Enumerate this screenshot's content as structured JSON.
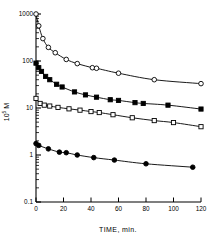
{
  "chart_data": {
    "type": "line",
    "title": "",
    "xlabel": "TIME, min.",
    "ylabel": "10^5 M",
    "ylabel_mantissa": "10",
    "ylabel_exponent": "5",
    "ylabel_unit": "M",
    "xlim": [
      0,
      120
    ],
    "ylim": [
      0.1,
      1000
    ],
    "yscale": "log",
    "xscale": "linear",
    "grid": false,
    "legend": "none",
    "xticks": [
      0,
      20,
      40,
      60,
      80,
      100,
      120
    ],
    "xticklabels": [
      "0",
      "20",
      "40",
      "60",
      "80",
      "100",
      "120"
    ],
    "yticks": [
      0.1,
      1,
      10,
      100,
      1000
    ],
    "yticklabels": [
      "0.1",
      "1",
      "10",
      "100",
      "1000"
    ],
    "minor_ticks": true,
    "series": [
      {
        "name": "open-circles",
        "marker": "open-circle",
        "color": "#000000",
        "x": [
          0,
          2,
          5,
          9,
          14,
          22,
          30,
          41,
          44,
          60,
          86,
          120
        ],
        "y": [
          1000,
          560,
          300,
          195,
          150,
          108,
          88,
          72,
          70,
          55,
          40,
          33
        ]
      },
      {
        "name": "filled-squares",
        "marker": "filled-square",
        "color": "#000000",
        "x": [
          0,
          2,
          4,
          7,
          10,
          15,
          19,
          28,
          36,
          44,
          54,
          60,
          72,
          78,
          96,
          120
        ],
        "y": [
          90,
          72,
          60,
          47,
          40,
          32,
          28,
          22,
          19,
          17,
          15,
          14.5,
          13,
          12.5,
          11.5,
          9.5
        ]
      },
      {
        "name": "open-squares",
        "marker": "open-square",
        "color": "#000000",
        "x": [
          0,
          3,
          6,
          10,
          16,
          24,
          32,
          40,
          46,
          56,
          70,
          86,
          100,
          120
        ],
        "y": [
          16,
          12.5,
          11.5,
          11,
          10.3,
          9.6,
          9.0,
          8.4,
          8.0,
          7.2,
          6.2,
          5.4,
          4.9,
          4.0
        ]
      },
      {
        "name": "filled-circles",
        "marker": "filled-circle",
        "color": "#000000",
        "x": [
          0,
          2,
          9,
          17,
          22,
          30,
          42,
          57,
          80,
          114
        ],
        "y": [
          1.75,
          1.6,
          1.35,
          1.15,
          1.12,
          1.0,
          0.88,
          0.78,
          0.65,
          0.55
        ]
      }
    ]
  },
  "axes": {
    "x_axis_name": "time-axis",
    "y_axis_name": "concentration-axis"
  }
}
